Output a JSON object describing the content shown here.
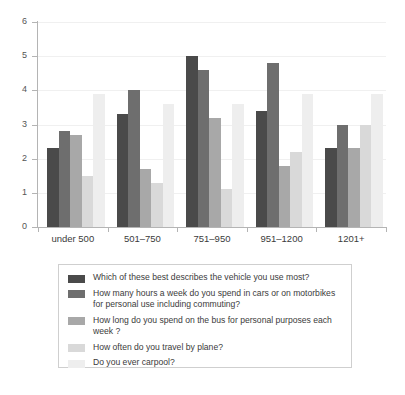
{
  "chart_data": {
    "type": "bar",
    "title": "",
    "xlabel": "",
    "ylabel": "",
    "ylim": [
      0,
      6
    ],
    "yticks": [
      0,
      1,
      2,
      3,
      4,
      5,
      6
    ],
    "grid": true,
    "legend_position": "below",
    "categories": [
      "under 500",
      "501–750",
      "751–950",
      "951–1200",
      "1201+"
    ],
    "series": [
      {
        "name": "Which of these best describes the vehicle you use most?",
        "color": "#4a4a4a",
        "values": [
          2.3,
          3.3,
          5.0,
          3.4,
          2.3
        ]
      },
      {
        "name": "How many hours a week do you spend in cars or on motorbikes for personal use including commuting?",
        "color": "#6e6e6e",
        "values": [
          2.8,
          4.0,
          4.6,
          4.8,
          3.0
        ]
      },
      {
        "name": "How long do you spend on the bus for personal purposes each week ?",
        "color": "#a8a8a8",
        "values": [
          2.7,
          1.7,
          3.2,
          1.8,
          2.3
        ]
      },
      {
        "name": "How often do you travel by plane?",
        "color": "#d9d9d9",
        "values": [
          1.5,
          1.3,
          1.1,
          2.2,
          3.0
        ]
      },
      {
        "name": "Do you ever carpool?",
        "color": "#eeeeee",
        "values": [
          3.9,
          3.6,
          3.6,
          3.9,
          3.9
        ]
      }
    ]
  },
  "legend": {
    "items": [
      {
        "label": "Which of these best describes the vehicle you use most?"
      },
      {
        "label": "How many hours a week do you spend in cars or on motorbikes for personal use including commuting?"
      },
      {
        "label": "How long do you spend on the bus for personal purposes each week ?"
      },
      {
        "label": "How often do you travel by plane?"
      },
      {
        "label": "Do you ever carpool?"
      }
    ]
  },
  "axis": {
    "y_labels": [
      "6",
      "5",
      "4",
      "3",
      "2",
      "1",
      "0"
    ],
    "x_labels": [
      "under 500",
      "501–750",
      "751–950",
      "951–1200",
      "1201+"
    ]
  }
}
